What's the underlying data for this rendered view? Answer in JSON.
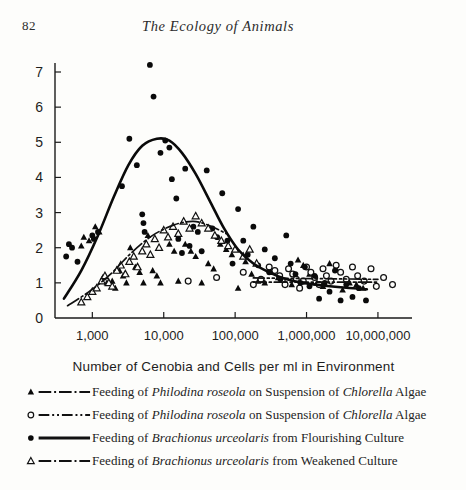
{
  "page": {
    "folio": "82",
    "running_title": "The Ecology of Animals",
    "background": "#fdfdfb",
    "ink": "#1a1a1a"
  },
  "chart_data": {
    "type": "scatter",
    "title": "",
    "xlabel": "Number of Cenobia and Cells per ml in Environment",
    "ylabel": "",
    "xscale": "log",
    "xlim": [
      300,
      30000000
    ],
    "ylim": [
      0,
      7.4
    ],
    "grid": false,
    "legend_position": "below",
    "xticks": [
      1000,
      10000,
      100000,
      1000000,
      10000000
    ],
    "xtick_labels": [
      "1,000",
      "10,000",
      "100,000",
      "1,000,000",
      "10,000,000"
    ],
    "yticks": [
      0,
      1,
      2,
      3,
      4,
      5,
      6,
      7
    ],
    "ytick_labels": [
      "0",
      "1",
      "2",
      "3",
      "4",
      "5",
      "6",
      "7"
    ],
    "series": [
      {
        "name": "Feeding of Philodina roseola on Suspension of Chlorella Algae",
        "key": "philodina-solid",
        "marker": "filled-triangle",
        "linestyle": "dash-dot",
        "color": "#111111",
        "points": [
          [
            700,
            2.05
          ],
          [
            760,
            2.3
          ],
          [
            900,
            2.2
          ],
          [
            1100,
            2.6
          ],
          [
            1250,
            2.45
          ],
          [
            1400,
            1.15
          ],
          [
            1600,
            1.0
          ],
          [
            1900,
            1.05
          ],
          [
            2100,
            0.85
          ],
          [
            2400,
            1.35
          ],
          [
            2700,
            1.2
          ],
          [
            3000,
            1.0
          ],
          [
            3400,
            2.0
          ],
          [
            4000,
            1.45
          ],
          [
            4600,
            1.3
          ],
          [
            5200,
            1.0
          ],
          [
            6000,
            2.35
          ],
          [
            7000,
            1.35
          ],
          [
            8000,
            1.2
          ],
          [
            9000,
            1.0
          ],
          [
            12000,
            2.1
          ],
          [
            14000,
            1.9
          ],
          [
            16000,
            1.05
          ],
          [
            20000,
            2.1
          ],
          [
            24000,
            1.9
          ],
          [
            28000,
            1.75
          ],
          [
            34000,
            1.0
          ],
          [
            42000,
            1.55
          ],
          [
            50000,
            1.4
          ],
          [
            62000,
            2.1
          ],
          [
            75000,
            1.95
          ],
          [
            90000,
            1.8
          ],
          [
            110000,
            0.85
          ],
          [
            140000,
            1.6
          ],
          [
            170000,
            1.25
          ],
          [
            210000,
            1.05
          ],
          [
            260000,
            1.0
          ],
          [
            320000,
            1.3
          ],
          [
            400000,
            1.15
          ],
          [
            500000,
            1.0
          ],
          [
            620000,
            0.95
          ],
          [
            760000,
            1.65
          ],
          [
            900000,
            1.5
          ],
          [
            1100000,
            1.25
          ],
          [
            1400000,
            1.0
          ],
          [
            1700000,
            0.9
          ],
          [
            2100000,
            1.55
          ],
          [
            2600000,
            1.4
          ],
          [
            3200000,
            0.8
          ],
          [
            4000000,
            1.0
          ],
          [
            5000000,
            0.95
          ],
          [
            6200000,
            0.85
          ]
        ],
        "curve": [
          [
            180000,
            1.02
          ],
          [
            10000000,
            1.02
          ]
        ]
      },
      {
        "name": "Feeding of Philodina roseola on Suspension of Chlorella Algae",
        "key": "philodina-open",
        "marker": "open-circle",
        "linestyle": "dash-dot-dot",
        "color": "#111111",
        "points": [
          [
            22000,
            1.05
          ],
          [
            55000,
            1.15
          ],
          [
            130000,
            1.3
          ],
          [
            180000,
            0.95
          ],
          [
            230000,
            1.1
          ],
          [
            300000,
            1.45
          ],
          [
            360000,
            1.35
          ],
          [
            420000,
            1.2
          ],
          [
            500000,
            0.95
          ],
          [
            560000,
            1.4
          ],
          [
            640000,
            1.25
          ],
          [
            720000,
            1.1
          ],
          [
            800000,
            0.85
          ],
          [
            900000,
            1.05
          ],
          [
            1000000,
            1.45
          ],
          [
            1150000,
            1.3
          ],
          [
            1300000,
            1.15
          ],
          [
            1500000,
            0.95
          ],
          [
            1700000,
            1.4
          ],
          [
            1900000,
            1.2
          ],
          [
            2200000,
            1.05
          ],
          [
            2600000,
            1.5
          ],
          [
            3000000,
            1.3
          ],
          [
            3600000,
            1.1
          ],
          [
            4400000,
            1.45
          ],
          [
            5200000,
            1.2
          ],
          [
            6400000,
            1.05
          ],
          [
            8000000,
            1.4
          ],
          [
            9500000,
            0.9
          ],
          [
            12000000,
            1.15
          ],
          [
            16000000,
            0.95
          ]
        ],
        "curve": [
          [
            180000,
            1.14
          ],
          [
            10000000,
            1.1
          ]
        ]
      },
      {
        "name": "Feeding of Brachionus urceolaris from Flourishing Culture",
        "key": "brachionus-flourishing",
        "marker": "filled-circle",
        "linestyle": "solid",
        "color": "#0a0a0a",
        "points": [
          [
            430,
            1.75
          ],
          [
            470,
            2.1
          ],
          [
            520,
            2.0
          ],
          [
            620,
            1.6
          ],
          [
            1000,
            2.35
          ],
          [
            1050,
            2.25
          ],
          [
            1200,
            2.45
          ],
          [
            2600,
            3.75
          ],
          [
            3300,
            5.1
          ],
          [
            4200,
            4.35
          ],
          [
            5000,
            2.95
          ],
          [
            5200,
            2.7
          ],
          [
            5400,
            2.45
          ],
          [
            6400,
            7.2
          ],
          [
            7200,
            6.3
          ],
          [
            9000,
            4.7
          ],
          [
            10500,
            5.05
          ],
          [
            12000,
            4.85
          ],
          [
            13000,
            3.95
          ],
          [
            15000,
            3.4
          ],
          [
            16000,
            2.25
          ],
          [
            18000,
            1.85
          ],
          [
            20000,
            4.25
          ],
          [
            23000,
            2.05
          ],
          [
            26000,
            2.6
          ],
          [
            30000,
            2.45
          ],
          [
            34000,
            1.9
          ],
          [
            40000,
            4.2
          ],
          [
            48000,
            2.55
          ],
          [
            56000,
            2.3
          ],
          [
            66000,
            3.55
          ],
          [
            78000,
            2.2
          ],
          [
            92000,
            1.55
          ],
          [
            110000,
            3.1
          ],
          [
            130000,
            2.2
          ],
          [
            150000,
            1.8
          ],
          [
            180000,
            2.6
          ],
          [
            210000,
            1.5
          ],
          [
            260000,
            1.95
          ],
          [
            300000,
            1.3
          ],
          [
            360000,
            1.7
          ],
          [
            430000,
            1.1
          ],
          [
            520000,
            2.35
          ],
          [
            600000,
            1.55
          ],
          [
            700000,
            1.25
          ],
          [
            820000,
            1.0
          ],
          [
            950000,
            1.45
          ],
          [
            1100000,
            0.9
          ],
          [
            1300000,
            1.2
          ],
          [
            1500000,
            0.55
          ],
          [
            1800000,
            1.0
          ],
          [
            2100000,
            0.75
          ],
          [
            2500000,
            1.35
          ],
          [
            3000000,
            0.5
          ],
          [
            3600000,
            0.95
          ],
          [
            4400000,
            0.6
          ],
          [
            5400000,
            0.85
          ],
          [
            6800000,
            0.5
          ]
        ],
        "curve": [
          [
            400,
            0.55
          ],
          [
            700,
            1.35
          ],
          [
            1200,
            2.35
          ],
          [
            2000,
            3.45
          ],
          [
            3200,
            4.35
          ],
          [
            5000,
            4.9
          ],
          [
            8000,
            5.1
          ],
          [
            12000,
            5.05
          ],
          [
            18000,
            4.7
          ],
          [
            28000,
            4.1
          ],
          [
            45000,
            3.3
          ],
          [
            70000,
            2.55
          ],
          [
            110000,
            1.95
          ],
          [
            180000,
            1.55
          ],
          [
            300000,
            1.3
          ],
          [
            500000,
            1.12
          ],
          [
            900000,
            1.0
          ],
          [
            1800000,
            0.92
          ],
          [
            3600000,
            0.86
          ],
          [
            7000000,
            0.82
          ]
        ]
      },
      {
        "name": "Feeding of Brachionus urceolaris from Weakened Culture",
        "key": "brachionus-weakened",
        "marker": "open-triangle",
        "linestyle": "dash-dot",
        "color": "#111111",
        "points": [
          [
            700,
            0.45
          ],
          [
            850,
            0.6
          ],
          [
            1000,
            0.75
          ],
          [
            1150,
            0.85
          ],
          [
            1350,
            1.05
          ],
          [
            1500,
            1.2
          ],
          [
            1700,
            1.0
          ],
          [
            1900,
            0.9
          ],
          [
            2200,
            1.35
          ],
          [
            2500,
            1.5
          ],
          [
            2900,
            1.25
          ],
          [
            3300,
            1.6
          ],
          [
            3800,
            1.75
          ],
          [
            4300,
            1.45
          ],
          [
            5000,
            1.9
          ],
          [
            5700,
            2.1
          ],
          [
            6500,
            1.8
          ],
          [
            7500,
            2.25
          ],
          [
            8600,
            2.0
          ],
          [
            10000,
            2.5
          ],
          [
            11500,
            2.3
          ],
          [
            13500,
            2.6
          ],
          [
            16000,
            2.4
          ],
          [
            19000,
            2.75
          ],
          [
            23000,
            2.55
          ],
          [
            28000,
            2.9
          ],
          [
            34000,
            2.7
          ],
          [
            42000,
            2.55
          ],
          [
            52000,
            2.35
          ],
          [
            64000,
            2.2
          ],
          [
            80000,
            2.05
          ],
          [
            100000,
            1.95
          ],
          [
            130000,
            1.75
          ],
          [
            160000,
            1.95
          ],
          [
            200000,
            1.55
          ]
        ],
        "curve": [
          [
            450,
            0.35
          ],
          [
            900,
            0.75
          ],
          [
            1800,
            1.25
          ],
          [
            3500,
            1.85
          ],
          [
            7000,
            2.35
          ],
          [
            14000,
            2.65
          ],
          [
            26000,
            2.75
          ],
          [
            45000,
            2.62
          ],
          [
            75000,
            2.4
          ]
        ]
      }
    ]
  },
  "legend": {
    "entries": [
      {
        "marker": "filled-triangle",
        "linestyle": "dash-dot",
        "text_parts": [
          {
            "t": "Feeding of ",
            "i": false
          },
          {
            "t": "Philodina roseola",
            "i": true
          },
          {
            "t": " on Suspension of ",
            "i": false
          },
          {
            "t": "Chlorella",
            "i": true
          },
          {
            "t": " Algae",
            "i": false
          }
        ]
      },
      {
        "marker": "open-circle",
        "linestyle": "dash-dot-dot",
        "text_parts": [
          {
            "t": "Feeding of ",
            "i": false
          },
          {
            "t": "Philodina roseola",
            "i": true
          },
          {
            "t": " on Suspension of ",
            "i": false
          },
          {
            "t": "Chlorella",
            "i": true
          },
          {
            "t": " Algae",
            "i": false
          }
        ]
      },
      {
        "marker": "filled-circle",
        "linestyle": "solid",
        "text_parts": [
          {
            "t": "Feeding of ",
            "i": false
          },
          {
            "t": "Brachionus urceolaris",
            "i": true
          },
          {
            "t": " from Flourishing Culture",
            "i": false
          }
        ]
      },
      {
        "marker": "open-triangle",
        "linestyle": "dash-dot",
        "text_parts": [
          {
            "t": "Feeding of ",
            "i": false
          },
          {
            "t": "Brachionus urceolaris",
            "i": true
          },
          {
            "t": " from Weakened Culture",
            "i": false
          }
        ]
      }
    ]
  }
}
